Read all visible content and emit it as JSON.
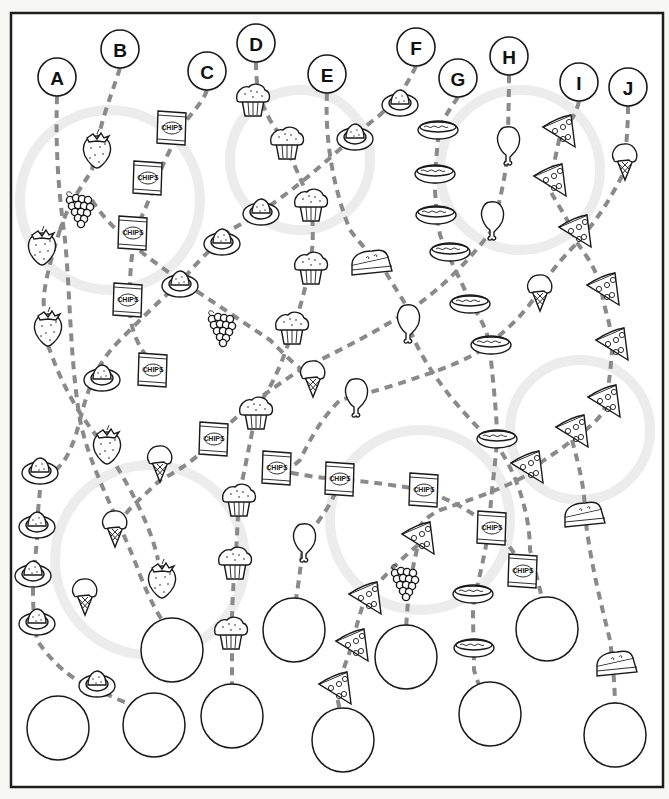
{
  "worksheet": {
    "title": "Food path maze",
    "colors": {
      "ink": "#1a1a1a",
      "dash": "#8a8a8a",
      "paper": "#ffffff",
      "frame": "#1e1e1e"
    },
    "start_labels": [
      {
        "letter": "A",
        "x": 57,
        "y": 77
      },
      {
        "letter": "B",
        "x": 120,
        "y": 49
      },
      {
        "letter": "C",
        "x": 207,
        "y": 71
      },
      {
        "letter": "D",
        "x": 256,
        "y": 43
      },
      {
        "letter": "E",
        "x": 327,
        "y": 74
      },
      {
        "letter": "F",
        "x": 416,
        "y": 47
      },
      {
        "letter": "G",
        "x": 458,
        "y": 78
      },
      {
        "letter": "H",
        "x": 509,
        "y": 56
      },
      {
        "letter": "I",
        "x": 579,
        "y": 82
      },
      {
        "letter": "J",
        "x": 628,
        "y": 87
      }
    ],
    "answer_circles": [
      {
        "x": 172,
        "y": 650
      },
      {
        "x": 294,
        "y": 630
      },
      {
        "x": 406,
        "y": 657
      },
      {
        "x": 547,
        "y": 629
      },
      {
        "x": 58,
        "y": 728
      },
      {
        "x": 154,
        "y": 725
      },
      {
        "x": 232,
        "y": 716
      },
      {
        "x": 343,
        "y": 740
      },
      {
        "x": 490,
        "y": 714
      },
      {
        "x": 615,
        "y": 735
      }
    ],
    "items": [
      {
        "type": "strawberry",
        "x": 97,
        "y": 150
      },
      {
        "type": "grapes",
        "x": 80,
        "y": 210
      },
      {
        "type": "strawberry",
        "x": 42,
        "y": 247
      },
      {
        "type": "strawberry",
        "x": 48,
        "y": 328
      },
      {
        "type": "egg",
        "x": 102,
        "y": 377
      },
      {
        "type": "strawberry",
        "x": 107,
        "y": 446
      },
      {
        "type": "egg",
        "x": 40,
        "y": 470
      },
      {
        "type": "icecream",
        "x": 160,
        "y": 460
      },
      {
        "type": "icecream",
        "x": 115,
        "y": 525
      },
      {
        "type": "egg",
        "x": 37,
        "y": 524
      },
      {
        "type": "egg",
        "x": 33,
        "y": 573
      },
      {
        "type": "icecream",
        "x": 85,
        "y": 593
      },
      {
        "type": "strawberry",
        "x": 162,
        "y": 580
      },
      {
        "type": "egg",
        "x": 37,
        "y": 621
      },
      {
        "type": "egg",
        "x": 97,
        "y": 683
      },
      {
        "type": "chips",
        "x": 172,
        "y": 128
      },
      {
        "type": "chips",
        "x": 148,
        "y": 178
      },
      {
        "type": "chips",
        "x": 133,
        "y": 233
      },
      {
        "type": "chips",
        "x": 128,
        "y": 300
      },
      {
        "type": "chips",
        "x": 153,
        "y": 370
      },
      {
        "type": "egg",
        "x": 180,
        "y": 283
      },
      {
        "type": "egg",
        "x": 222,
        "y": 241
      },
      {
        "type": "egg",
        "x": 261,
        "y": 211
      },
      {
        "type": "grapes",
        "x": 222,
        "y": 329
      },
      {
        "type": "muffin",
        "x": 253,
        "y": 100
      },
      {
        "type": "muffin",
        "x": 287,
        "y": 143
      },
      {
        "type": "muffin",
        "x": 311,
        "y": 205
      },
      {
        "type": "muffin",
        "x": 311,
        "y": 268
      },
      {
        "type": "muffin",
        "x": 292,
        "y": 328
      },
      {
        "type": "egg",
        "x": 355,
        "y": 136
      },
      {
        "type": "egg",
        "x": 400,
        "y": 102
      },
      {
        "type": "pie",
        "x": 372,
        "y": 263
      },
      {
        "type": "drumstick",
        "x": 408,
        "y": 321
      },
      {
        "type": "icecream",
        "x": 313,
        "y": 375
      },
      {
        "type": "drumstick",
        "x": 356,
        "y": 395
      },
      {
        "type": "muffin",
        "x": 256,
        "y": 413
      },
      {
        "type": "chips",
        "x": 214,
        "y": 439
      },
      {
        "type": "chips",
        "x": 277,
        "y": 468
      },
      {
        "type": "chips",
        "x": 340,
        "y": 479
      },
      {
        "type": "chips",
        "x": 424,
        "y": 490
      },
      {
        "type": "muffin",
        "x": 239,
        "y": 500
      },
      {
        "type": "muffin",
        "x": 235,
        "y": 563
      },
      {
        "type": "muffin",
        "x": 231,
        "y": 633
      },
      {
        "type": "drumstick",
        "x": 304,
        "y": 540
      },
      {
        "type": "pizza",
        "x": 418,
        "y": 538
      },
      {
        "type": "grapes",
        "x": 405,
        "y": 583
      },
      {
        "type": "pizza",
        "x": 365,
        "y": 598
      },
      {
        "type": "pizza",
        "x": 352,
        "y": 645
      },
      {
        "type": "pizza",
        "x": 335,
        "y": 688
      },
      {
        "type": "hotdog",
        "x": 438,
        "y": 128
      },
      {
        "type": "hotdog",
        "x": 435,
        "y": 172
      },
      {
        "type": "hotdog",
        "x": 436,
        "y": 213
      },
      {
        "type": "hotdog",
        "x": 450,
        "y": 250
      },
      {
        "type": "hotdog",
        "x": 470,
        "y": 302
      },
      {
        "type": "hotdog",
        "x": 491,
        "y": 343
      },
      {
        "type": "hotdog",
        "x": 497,
        "y": 437
      },
      {
        "type": "hotdog",
        "x": 473,
        "y": 592
      },
      {
        "type": "hotdog",
        "x": 474,
        "y": 646
      },
      {
        "type": "drumstick",
        "x": 508,
        "y": 143
      },
      {
        "type": "drumstick",
        "x": 492,
        "y": 218
      },
      {
        "type": "icecream",
        "x": 540,
        "y": 289
      },
      {
        "type": "chips",
        "x": 492,
        "y": 528
      },
      {
        "type": "chips",
        "x": 523,
        "y": 571
      },
      {
        "type": "pizza",
        "x": 559,
        "y": 131
      },
      {
        "type": "pizza",
        "x": 550,
        "y": 180
      },
      {
        "type": "pizza",
        "x": 575,
        "y": 231
      },
      {
        "type": "pizza",
        "x": 603,
        "y": 289
      },
      {
        "type": "pizza",
        "x": 612,
        "y": 344
      },
      {
        "type": "pizza",
        "x": 604,
        "y": 401
      },
      {
        "type": "pizza",
        "x": 572,
        "y": 431
      },
      {
        "type": "pizza",
        "x": 527,
        "y": 467
      },
      {
        "type": "pie",
        "x": 585,
        "y": 515
      },
      {
        "type": "pie",
        "x": 617,
        "y": 664
      },
      {
        "type": "icecream",
        "x": 625,
        "y": 158
      }
    ],
    "paths": [
      "M57,96 C55,160 60,200 65,240 C70,290 70,360 80,420 C90,470 120,520 140,575 C150,600 160,620 170,630",
      "M120,68 C110,100 100,120 92,170 C80,190 70,200 60,230",
      "M60,230 C50,260 40,300 45,310",
      "M48,345 C60,380 75,410 100,440 C120,470 150,520 158,560",
      "M207,90 C200,110 180,120 170,150 C155,180 150,200 140,220 C130,250 130,280 130,290",
      "M130,310 C130,330 140,350 150,360",
      "M92,200 C110,230 150,260 180,280 C210,300 240,320 270,340 C290,360 300,370 310,375",
      "M256,62 C256,90 260,100 270,120 C290,150 300,180 310,200 C315,230 312,250 311,260 C305,290 300,310 295,320 C285,360 270,390 258,405 C250,440 245,470 240,490 C237,520 237,550 235,560 C233,590 232,610 232,620 C232,660 232,690 232,700",
      "M327,93 C325,130 330,180 350,230 C365,250 375,258 380,262 C395,290 405,300 410,315",
      "M410,330 C430,380 470,420 500,450 C520,480 530,520 530,550 C535,570 540,590 545,610",
      "M416,66 C405,90 395,100 380,115 C360,130 340,150 310,175 C280,200 250,220 230,230 C200,260 190,270 180,283 C160,300 140,320 120,340 C100,360 90,380 80,420 C70,460 55,480 40,470",
      "M40,490 C38,510 37,520 37,540 C35,560 34,570 33,590 C33,610 34,620 37,640 C50,660 70,680 97,690 C120,700 140,710 154,710",
      "M458,97 C450,110 440,120 438,140 C436,160 435,170 435,190 C436,205 436,210 440,235 C450,260 460,280 470,300 C480,320 490,330 491,360 C495,400 497,420 497,440 C495,470 490,500 490,520 C485,560 475,590 473,610 C473,630 474,650 474,670 C480,690 485,700 490,700",
      "M509,75 C509,100 508,120 508,150 C505,180 500,200 492,230 C470,260 440,290 410,310 C380,330 340,350 300,370 C270,390 240,410 214,440 C195,460 180,470 160,480 C140,500 125,510 115,530",
      "M579,101 C575,120 565,125 559,140 C555,160 552,170 550,190 C560,210 570,220 575,240 C590,260 600,275 603,300 C608,320 612,330 612,350 C610,380 607,395 604,410 C595,425 585,430 572,440 C555,455 540,460 527,475 C500,490 470,500 440,510 C420,520 415,530 418,545 C412,570 408,590 406,630",
      "M628,106 C628,130 626,140 625,170 C610,200 600,215 580,240 C560,260 548,275 540,290 C520,320 505,330 491,343 C470,360 440,370 410,380 C380,390 360,395 340,400 C320,420 310,440 300,460 C290,470 280,470 277,470",
      "M277,470 C300,475 320,478 340,479 C370,482 400,486 424,490 C450,500 470,510 492,528 C510,545 520,560 523,571",
      "M340,479 C335,500 320,520 304,540 C300,570 298,590 294,610",
      "M572,440 C580,470 585,490 585,515 C590,560 600,600 610,640 C615,680 615,700 615,715",
      "M418,545 C400,560 380,580 365,598 C358,620 354,635 352,645 C345,665 340,680 335,688 C340,710 342,720 343,725"
    ],
    "ghost_letters": [
      "S",
      "N",
      "A",
      "C",
      "K"
    ]
  }
}
